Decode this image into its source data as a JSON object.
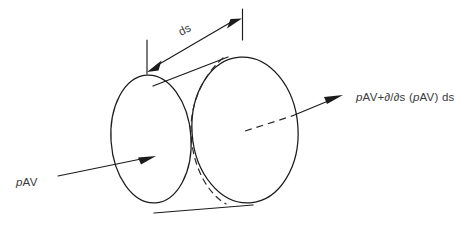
{
  "figure": {
    "background_color": "#ffffff",
    "line_color": "#1b1b1b",
    "text_color": "#3a3a3a"
  },
  "labels": {
    "dimension": {
      "text": "ds",
      "meaning": "differential length along stream direction"
    },
    "inflow": {
      "prefix_italic": "p",
      "rest": "AV",
      "full_text": "pAV"
    },
    "outflow": {
      "segment_1_italic": "p",
      "segment_2": "AV+",
      "segment_3_italic": "∂",
      "segment_4": "/",
      "segment_5_italic": "∂",
      "segment_6": "s (",
      "segment_7_italic": "p",
      "segment_8": "AV) ds",
      "full_text": "pAV+∂/∂s (pAV) ds"
    }
  },
  "geometry": {
    "left_face": {
      "cx": 151,
      "cy": 139,
      "rx": 40,
      "ry": 64,
      "rotation_deg": -4
    },
    "right_face": {
      "cx": 245,
      "cy": 130,
      "rx": 53,
      "ry": 73,
      "rotation_deg": -4
    },
    "dimension_line": {
      "x1": 149,
      "y1": 70,
      "x2": 240,
      "y2": 17
    },
    "tick_left": {
      "x": 147,
      "y1": 40,
      "y2": 74
    },
    "tick_right": {
      "x": 242,
      "y1": 9,
      "y2": 40
    },
    "inflow_arrow": {
      "x1": 58,
      "y1": 176,
      "x2": 155,
      "y2": 156
    },
    "outflow_arrow": {
      "x1": 247,
      "y1": 128,
      "x2": 342,
      "y2": 96
    }
  }
}
